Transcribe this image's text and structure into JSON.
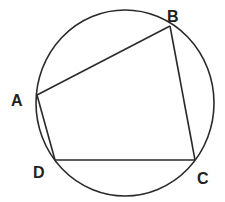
{
  "diagram": {
    "stroke_color": "#2a2a2a",
    "circle": {
      "cx": 125,
      "cy": 103,
      "rx": 89,
      "ry": 93
    },
    "points": {
      "A": {
        "label": "A",
        "x": 37,
        "y": 95,
        "lx": 11,
        "ly": 106
      },
      "B": {
        "label": "B",
        "x": 170,
        "y": 26,
        "lx": 167,
        "ly": 22
      },
      "C": {
        "label": "C",
        "x": 195,
        "y": 160,
        "lx": 197,
        "ly": 184
      },
      "D": {
        "label": "D",
        "x": 55,
        "y": 160,
        "lx": 33,
        "ly": 178
      }
    },
    "segments": [
      {
        "name": "AB",
        "from": "A",
        "to": "B"
      },
      {
        "name": "BC",
        "from": "B",
        "to": "C"
      },
      {
        "name": "CD",
        "from": "C",
        "to": "D"
      },
      {
        "name": "DA",
        "from": "D",
        "to": "A"
      }
    ]
  }
}
